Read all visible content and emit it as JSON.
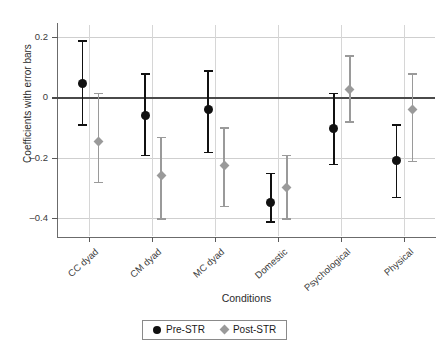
{
  "chart_data": {
    "type": "scatter",
    "title": "",
    "xlabel": "Conditions",
    "ylabel": "Coefficients with error bars",
    "categories": [
      "CC dyad",
      "CM dyad",
      "MC dyad",
      "Domestic",
      "Psychological",
      "Physical"
    ],
    "ylim": [
      -0.46,
      0.24
    ],
    "yticks": [
      0.2,
      0,
      -0.2,
      -0.4
    ],
    "ytick_labels": [
      "0.2",
      "0",
      "–0.2",
      "–0.4"
    ],
    "grid": true,
    "legend_position": "bottom-center",
    "zero_reference_line": 0,
    "series": [
      {
        "name": "Pre-STR",
        "marker": "circle",
        "color": "#111111",
        "values": [
          0.045,
          -0.06,
          -0.04,
          -0.35,
          -0.105,
          -0.21
        ],
        "ci_upper": [
          0.19,
          0.08,
          0.09,
          -0.25,
          0.016,
          -0.09
        ],
        "ci_lower": [
          -0.09,
          -0.19,
          -0.18,
          -0.41,
          -0.22,
          -0.33
        ]
      },
      {
        "name": "Post-STR",
        "marker": "diamond",
        "color": "#9a9a9a",
        "values": [
          -0.145,
          -0.26,
          -0.225,
          -0.3,
          0.025,
          -0.04
        ],
        "ci_upper": [
          0.016,
          -0.13,
          -0.1,
          -0.19,
          0.14,
          0.08
        ],
        "ci_lower": [
          -0.28,
          -0.4,
          -0.36,
          -0.4,
          -0.08,
          -0.21
        ]
      }
    ]
  },
  "axes": {
    "y_title": "Coefficients with error bars",
    "x_title": "Conditions",
    "y_tick_labels": [
      "0.2",
      "0",
      "–0.2",
      "–0.4"
    ],
    "x_tick_labels": [
      "CC dyad",
      "CM dyad",
      "MC dyad",
      "Domestic",
      "Psychological",
      "Physical"
    ]
  },
  "legend": {
    "items": [
      {
        "label": "Pre-STR",
        "marker": "circle-marker",
        "color": "#111111"
      },
      {
        "label": "Post-STR",
        "marker": "diamond-marker",
        "color": "#9a9a9a"
      }
    ]
  },
  "colors": {
    "pre_str": "#111111",
    "post_str": "#9a9a9a",
    "grid": "#cfcfcf",
    "axis": "#6b6b6b",
    "zero_line": "#4a4a4a",
    "background": "#ffffff"
  }
}
